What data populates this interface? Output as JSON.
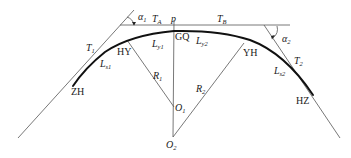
{
  "diagram": {
    "type": "compound curve with transition (spiral) curves",
    "labels": {
      "alpha1": {
        "main": "α",
        "sub": "1"
      },
      "alpha2": {
        "main": "α",
        "sub": "2"
      },
      "TA": {
        "main": "T",
        "sub": "A"
      },
      "TB": {
        "main": "T",
        "sub": "B"
      },
      "p": {
        "main": "p"
      },
      "GQ": {
        "main": "GQ"
      },
      "T1": {
        "main": "T",
        "sub": "1"
      },
      "T2": {
        "main": "T",
        "sub": "2"
      },
      "HY": {
        "main": "HY"
      },
      "YH": {
        "main": "YH"
      },
      "Ly1": {
        "main": "L",
        "sub": "y1"
      },
      "Ly2": {
        "main": "L",
        "sub": "y2"
      },
      "Ls1": {
        "main": "L",
        "sub": "s1"
      },
      "Ls2": {
        "main": "L",
        "sub": "s2"
      },
      "R1": {
        "main": "R",
        "sub": "1"
      },
      "R2": {
        "main": "R",
        "sub": "2"
      },
      "O1": {
        "main": "O",
        "sub": "1"
      },
      "O2": {
        "main": "O",
        "sub": "2"
      },
      "ZH": {
        "main": "ZH"
      },
      "HZ": {
        "main": "HZ"
      }
    },
    "colors": {
      "line": "#555555",
      "curve": "#111111",
      "text": "#1a1a1a",
      "background": "#ffffff"
    }
  }
}
